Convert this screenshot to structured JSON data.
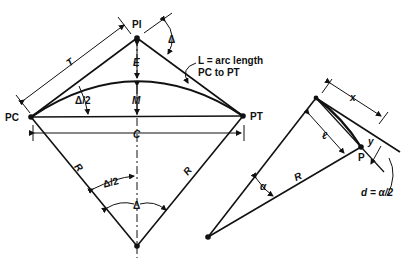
{
  "diagram": {
    "colors": {
      "ink": "#111111",
      "background": "#ffffff"
    },
    "labels": {
      "pi": "PI",
      "pc": "PC",
      "pt": "PT",
      "tangent": "T",
      "delta": "Δ",
      "half_delta_top": "Δ/2",
      "half_delta_center": "Δ/2",
      "external": "E",
      "middle_ordinate": "M",
      "chord": "C",
      "radius_left": "R",
      "radius_right": "R",
      "delta_center": "Δ",
      "arc_note_line1": "L = arc length",
      "arc_note_line2": "PC to PT"
    },
    "detail": {
      "x": "x",
      "y": "y",
      "l": "ℓ",
      "p": "P",
      "r": "R",
      "alpha": "α",
      "deflection": "d = α/2"
    }
  }
}
